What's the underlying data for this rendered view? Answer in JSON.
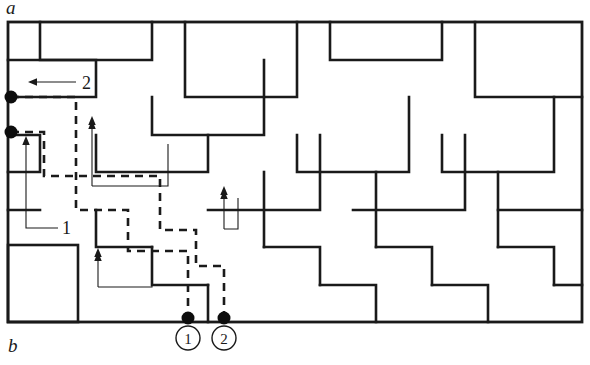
{
  "figure": {
    "panel_top_label": "a",
    "panel_bottom_label": "b",
    "callouts": [
      {
        "id": "callout-2",
        "text": "2",
        "x": 82,
        "y": 89
      },
      {
        "id": "callout-1",
        "text": "1",
        "x": 62,
        "y": 234
      }
    ],
    "bottom_markers": [
      {
        "id": "marker-1",
        "text": "1",
        "cx": 188,
        "cy": 338,
        "r": 12,
        "dot_x": 188,
        "dot_y": 318
      },
      {
        "id": "marker-2",
        "text": "2",
        "cx": 224,
        "cy": 338,
        "r": 12,
        "dot_x": 224,
        "dot_y": 318
      }
    ],
    "left_nodes": [
      {
        "id": "left-node-upper",
        "cx": 11,
        "cy": 97,
        "r": 6.5
      },
      {
        "id": "left-node-lower",
        "cx": 11,
        "cy": 132,
        "r": 6.5
      }
    ],
    "frame": {
      "x": 8,
      "y": 22,
      "width": 574,
      "height": 300
    },
    "inner_box": {
      "x": 8,
      "y": 245,
      "width": 70,
      "height": 77
    },
    "colors": {
      "ink": "#1a1a1a",
      "background": "#ffffff",
      "node_fill": "#0d0d0d"
    },
    "walls": [
      "M 40,22 L 40,60 L 152,60 L 152,22",
      "M 185,22 L 185,97 L 297,97 L 297,22",
      "M 330,22 L 330,60 L 442,60 L 442,22",
      "M 475,22 L 475,97 L 582,97",
      "M 8,60 L 96,60 L 96,97 L 8,97",
      "M 152,97 L 152,135 L 264,135 L 264,60",
      "M 297,135 L 297,172 L 409,172 L 409,97",
      "M 442,135 L 442,172 L 554,172 L 554,97",
      "M 8,135 L 40,135 L 40,172 L 8,172",
      "M 96,135 L 96,172 L 208,172 L 208,135",
      "M 208,210 L 320,210 L 320,135",
      "M 353,210 L 465,210 L 465,135",
      "M 498,210 L 582,210",
      "M 8,210 L 40,210",
      "M 96,210 L 96,247 L 152,247",
      "M 264,247 L 264,172",
      "M 376,247 L 376,172",
      "M 498,247 L 498,172",
      "M 152,247 L 152,285 L 208,285",
      "M 264,247 L 320,247 L 320,285",
      "M 376,247 L 432,247 L 432,285",
      "M 498,247 L 554,247 L 554,285",
      "M 208,285 L 208,322",
      "M 320,285 L 376,285 L 376,322",
      "M 432,285 L 488,285 L 488,322",
      "M 554,285 L 582,285"
    ],
    "dashed_paths": [
      "M 11,97 L 76,97 L 76,210 L 128,210 L 128,251 L 188,251 L 188,318",
      "M 11,132 L 44,132 L 44,176 L 160,176 L 160,230 L 196,230 L 196,266 L 224,266 L 224,318"
    ],
    "leaders": [
      {
        "id": "leader-callout-2",
        "path": "M 30,82 L 76,82",
        "arrow": {
          "x": 28,
          "y": 82,
          "dir": "left"
        }
      },
      {
        "id": "leader-callout-1",
        "path": "M 26,140 L 26,228 L 58,228",
        "arrow": {
          "x": 26,
          "y": 136,
          "dir": "up"
        }
      },
      {
        "id": "leader-inner-up-a",
        "path": "M 92,186 L 168,186 L 168,144",
        "arrow": {
          "x": 92,
          "y": 120,
          "dir": "up"
        }
      },
      {
        "id": "leader-inner-up-b",
        "path": "M 92,120 L 92,186",
        "arrow": {
          "x": 92,
          "y": 116,
          "dir": "up"
        }
      },
      {
        "id": "leader-inner-up-c",
        "path": "M 98,287 L 152,287 L 152,262",
        "arrow": {
          "x": 98,
          "y": 252,
          "dir": "up"
        }
      },
      {
        "id": "leader-inner-up-d",
        "path": "M 98,252 L 98,287",
        "arrow": {
          "x": 98,
          "y": 248,
          "dir": "up"
        }
      },
      {
        "id": "leader-inner-up-e",
        "path": "M 224,229 L 238,229 L 238,198",
        "arrow": {
          "x": 224,
          "y": 190,
          "dir": "up"
        }
      },
      {
        "id": "leader-inner-up-f",
        "path": "M 224,190 L 224,229",
        "arrow": {
          "x": 224,
          "y": 186,
          "dir": "up"
        }
      }
    ]
  }
}
